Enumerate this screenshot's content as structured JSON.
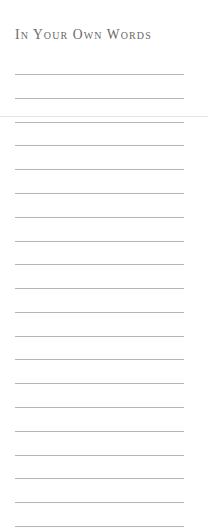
{
  "page": {
    "title": "In Your Own Words",
    "writing_lines_count": 20,
    "text_color": "#6a6a6a",
    "rule_color": "#b4b4b4"
  }
}
